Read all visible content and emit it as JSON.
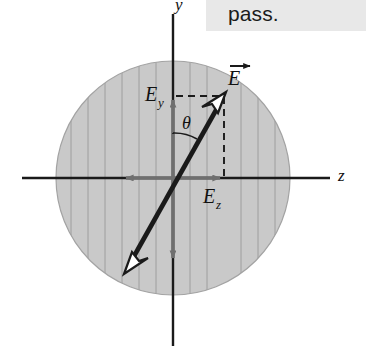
{
  "figure": {
    "kind": "physics-vector-diagram",
    "background_color": "#ffffff",
    "disk": {
      "name": "hatched-circle",
      "center_x": 173,
      "center_y": 178,
      "radius": 117,
      "fill_color": "#c9c9c9",
      "stroke_color": "#9a9a9a",
      "hatch_color": "#9e9e9e",
      "hatch_orientation": "vertical",
      "hatch_spacing": 17
    },
    "axes": {
      "y_axis": {
        "label": "y",
        "x": 173,
        "top_y": 14,
        "bottom_y": 346,
        "color": "#1a1a1a"
      },
      "z_axis": {
        "label": "z",
        "y": 178,
        "left_x": 22,
        "right_x": 330,
        "color": "#1a1a1a"
      }
    },
    "vectors": {
      "E": {
        "label": "E",
        "has_vector_arrow": true,
        "color": "#1a1a1a",
        "tip_x": 224,
        "tip_y": 97,
        "tail_x": 129,
        "tail_y": 265,
        "arrowhead_style": "hollow",
        "double_ended": true
      },
      "E_y": {
        "label": "E",
        "subscript": "y",
        "color": "#6f6f6f",
        "from_x": 173,
        "from_y": 178,
        "to_x": 173,
        "to_y": 96
      },
      "E_z": {
        "label": "E",
        "subscript": "z",
        "color": "#6f6f6f",
        "from_x": 173,
        "from_y": 178,
        "to_x": 224,
        "to_y": 178
      },
      "y_negative": {
        "name": "negative-y-arrow",
        "color": "#6f6f6f",
        "from_x": 173,
        "from_y": 178,
        "to_x": 173,
        "to_y": 262
      },
      "z_negative": {
        "name": "negative-z-arrow",
        "color": "#6f6f6f",
        "from_x": 173,
        "from_y": 178,
        "to_x": 122,
        "to_y": 178
      }
    },
    "angle": {
      "label": "θ",
      "label_x": 181,
      "label_y": 122,
      "vertex_x": 173,
      "vertex_y": 178,
      "between": "y-axis and E"
    },
    "dashed_guides": {
      "color": "#1a1a1a",
      "horizontal": {
        "from_x": 173,
        "to_x": 224,
        "y": 96
      },
      "vertical": {
        "x": 224,
        "from_y": 97,
        "to_y": 178
      }
    },
    "labels": {
      "E_vector": "E",
      "E_y_base": "E",
      "E_y_sub": "y",
      "E_z_base": "E",
      "E_z_sub": "z",
      "theta": "θ",
      "y_axis": "y",
      "z_axis": "z"
    }
  },
  "caption": {
    "text": "pass.",
    "background_color": "#e8e8e8",
    "text_color": "#1b1b1b"
  }
}
